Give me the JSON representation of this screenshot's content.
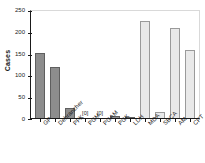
{
  "chart_data": {
    "type": "bar",
    "title": "",
    "subtitle": "",
    "xlabel": "",
    "ylabel": "Cases",
    "ylim": [
      0,
      250
    ],
    "yticks": [
      0,
      50,
      100,
      150,
      200,
      250
    ],
    "grid": false,
    "legend": false,
    "categories": [
      "GP",
      "Debrancher",
      "PFK",
      "PGM",
      "PGAM",
      "PGK",
      "LDH",
      "MDA",
      "SBCA",
      "AM",
      "CPT"
    ],
    "values": [
      148,
      116,
      22,
      0,
      0,
      5,
      2,
      222,
      13,
      206,
      157
    ],
    "bar_styles": [
      "dark",
      "dark",
      "dark",
      "dark",
      "dark",
      "dark",
      "dark",
      "light",
      "light",
      "light",
      "light"
    ],
    "annotations": [
      {
        "index": 3,
        "text": "[0]"
      },
      {
        "index": 4,
        "text": "[0]"
      }
    ],
    "colors": {
      "dark_bar": "#8d8d8d",
      "dark_bar_edge": "#5f5f5f",
      "light_bar": "#e9e9e9",
      "light_bar_edge": "#9a9a9a",
      "axis": "#1a1a1a",
      "frame": "#d9d9d9",
      "background": "#ffffff"
    }
  }
}
